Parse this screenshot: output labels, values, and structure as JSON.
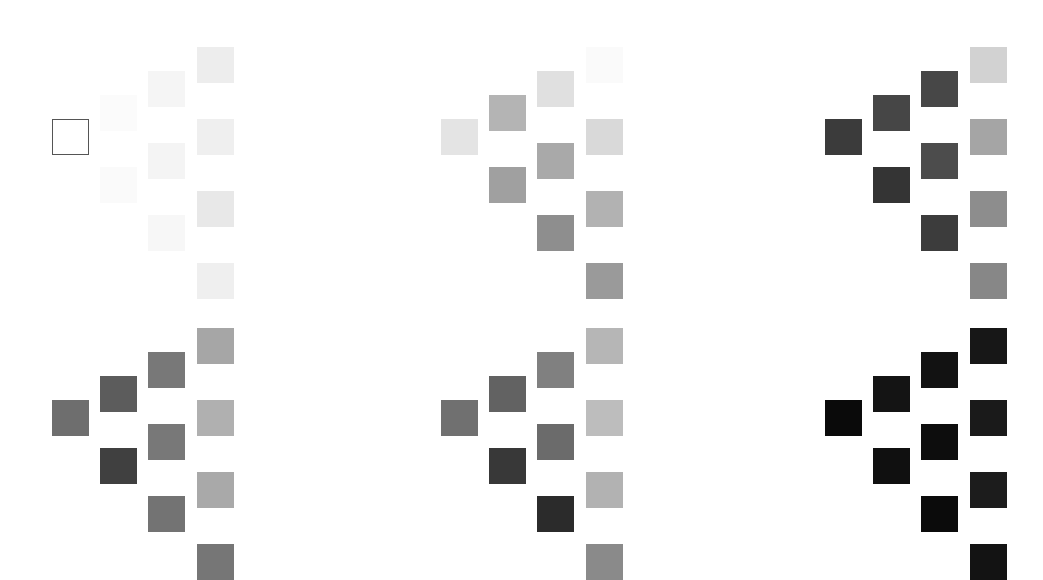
{
  "figure": {
    "title": "",
    "background_color": "#ffffff",
    "width": 1043,
    "height": 550,
    "panel_rows": 2,
    "panel_cols": 3,
    "panel_count": 6
  },
  "geometry": {
    "cell_width": 37,
    "cell_height": 36,
    "col_step": 48,
    "row_step": 48,
    "panel_x_origins": [
      52,
      441,
      825
    ],
    "panel_y_origins": [
      47,
      328
    ],
    "column_counts": [
      1,
      2,
      3,
      4
    ],
    "column_x_offsets": [
      0,
      48,
      96,
      145
    ],
    "column_y_offsets": [
      [
        72
      ],
      [
        48,
        120
      ],
      [
        24,
        96,
        168
      ],
      [
        0,
        72,
        144,
        216
      ]
    ]
  },
  "chart_data": {
    "type": "heatmap",
    "title": "",
    "subtitle": "",
    "xlabel": "",
    "ylabel": "",
    "legend": [],
    "grid": false,
    "value_range": [
      0,
      1
    ],
    "colormap": "grayscale",
    "panels": [
      {
        "index": 0,
        "name": "panel-top-left",
        "position": {
          "row": 0,
          "col": 0
        },
        "columns": [
          {
            "index": 0,
            "cells": [
              {
                "color": "#ffffff",
                "outlined": true,
                "value": 0.0
              }
            ]
          },
          {
            "index": 1,
            "cells": [
              {
                "color": "#fbfbfb",
                "outlined": false,
                "value": 0.02
              },
              {
                "color": "#fafafa",
                "outlined": false,
                "value": 0.02
              }
            ]
          },
          {
            "index": 2,
            "cells": [
              {
                "color": "#f5f5f5",
                "outlined": false,
                "value": 0.04
              },
              {
                "color": "#f4f4f4",
                "outlined": false,
                "value": 0.05
              },
              {
                "color": "#f7f7f7",
                "outlined": false,
                "value": 0.03
              }
            ]
          },
          {
            "index": 3,
            "cells": [
              {
                "color": "#ededed",
                "outlined": false,
                "value": 0.07
              },
              {
                "color": "#efefef",
                "outlined": false,
                "value": 0.06
              },
              {
                "color": "#e8e8e8",
                "outlined": false,
                "value": 0.09
              },
              {
                "color": "#efefef",
                "outlined": false,
                "value": 0.06
              }
            ]
          }
        ]
      },
      {
        "index": 1,
        "name": "panel-top-center",
        "position": {
          "row": 0,
          "col": 1
        },
        "columns": [
          {
            "index": 0,
            "cells": [
              {
                "color": "#e4e4e4",
                "outlined": false,
                "value": 0.11
              }
            ]
          },
          {
            "index": 1,
            "cells": [
              {
                "color": "#b4b4b4",
                "outlined": false,
                "value": 0.29
              },
              {
                "color": "#a0a0a0",
                "outlined": false,
                "value": 0.37
              }
            ]
          },
          {
            "index": 2,
            "cells": [
              {
                "color": "#e0e0e0",
                "outlined": false,
                "value": 0.12
              },
              {
                "color": "#a9a9a9",
                "outlined": false,
                "value": 0.34
              },
              {
                "color": "#8e8e8e",
                "outlined": false,
                "value": 0.44
              }
            ]
          },
          {
            "index": 3,
            "cells": [
              {
                "color": "#fafafa",
                "outlined": false,
                "value": 0.02
              },
              {
                "color": "#d9d9d9",
                "outlined": false,
                "value": 0.15
              },
              {
                "color": "#b2b2b2",
                "outlined": false,
                "value": 0.3
              },
              {
                "color": "#9a9a9a",
                "outlined": false,
                "value": 0.4
              }
            ]
          }
        ]
      },
      {
        "index": 2,
        "name": "panel-top-right",
        "position": {
          "row": 0,
          "col": 2
        },
        "columns": [
          {
            "index": 0,
            "cells": [
              {
                "color": "#3b3b3b",
                "outlined": false,
                "value": 0.77
              }
            ]
          },
          {
            "index": 1,
            "cells": [
              {
                "color": "#464646",
                "outlined": false,
                "value": 0.73
              },
              {
                "color": "#343434",
                "outlined": false,
                "value": 0.8
              }
            ]
          },
          {
            "index": 2,
            "cells": [
              {
                "color": "#474747",
                "outlined": false,
                "value": 0.72
              },
              {
                "color": "#4c4c4c",
                "outlined": false,
                "value": 0.7
              },
              {
                "color": "#3c3c3c",
                "outlined": false,
                "value": 0.76
              }
            ]
          },
          {
            "index": 3,
            "cells": [
              {
                "color": "#d2d2d2",
                "outlined": false,
                "value": 0.18
              },
              {
                "color": "#a5a5a5",
                "outlined": false,
                "value": 0.35
              },
              {
                "color": "#8d8d8d",
                "outlined": false,
                "value": 0.45
              },
              {
                "color": "#878787",
                "outlined": false,
                "value": 0.47
              }
            ]
          }
        ]
      },
      {
        "index": 3,
        "name": "panel-bottom-left",
        "position": {
          "row": 1,
          "col": 0
        },
        "columns": [
          {
            "index": 0,
            "cells": [
              {
                "color": "#6e6e6e",
                "outlined": false,
                "value": 0.57
              }
            ]
          },
          {
            "index": 1,
            "cells": [
              {
                "color": "#5c5c5c",
                "outlined": false,
                "value": 0.64
              },
              {
                "color": "#404040",
                "outlined": false,
                "value": 0.75
              }
            ]
          },
          {
            "index": 2,
            "cells": [
              {
                "color": "#787878",
                "outlined": false,
                "value": 0.53
              },
              {
                "color": "#787878",
                "outlined": false,
                "value": 0.53
              },
              {
                "color": "#737373",
                "outlined": false,
                "value": 0.55
              }
            ]
          },
          {
            "index": 3,
            "cells": [
              {
                "color": "#a6a6a6",
                "outlined": false,
                "value": 0.35
              },
              {
                "color": "#b0b0b0",
                "outlined": false,
                "value": 0.31
              },
              {
                "color": "#a9a9a9",
                "outlined": false,
                "value": 0.34
              },
              {
                "color": "#767676",
                "outlined": false,
                "value": 0.54
              }
            ]
          }
        ]
      },
      {
        "index": 4,
        "name": "panel-bottom-center",
        "position": {
          "row": 1,
          "col": 1
        },
        "columns": [
          {
            "index": 0,
            "cells": [
              {
                "color": "#707070",
                "outlined": false,
                "value": 0.56
              }
            ]
          },
          {
            "index": 1,
            "cells": [
              {
                "color": "#626262",
                "outlined": false,
                "value": 0.62
              },
              {
                "color": "#383838",
                "outlined": false,
                "value": 0.78
              }
            ]
          },
          {
            "index": 2,
            "cells": [
              {
                "color": "#808080",
                "outlined": false,
                "value": 0.5
              },
              {
                "color": "#6b6b6b",
                "outlined": false,
                "value": 0.58
              },
              {
                "color": "#2b2b2b",
                "outlined": false,
                "value": 0.83
              }
            ]
          },
          {
            "index": 3,
            "cells": [
              {
                "color": "#b6b6b6",
                "outlined": false,
                "value": 0.29
              },
              {
                "color": "#bdbdbd",
                "outlined": false,
                "value": 0.26
              },
              {
                "color": "#b2b2b2",
                "outlined": false,
                "value": 0.3
              },
              {
                "color": "#8a8a8a",
                "outlined": false,
                "value": 0.46
              }
            ]
          }
        ]
      },
      {
        "index": 5,
        "name": "panel-bottom-right",
        "position": {
          "row": 1,
          "col": 2
        },
        "columns": [
          {
            "index": 0,
            "cells": [
              {
                "color": "#0a0a0a",
                "outlined": false,
                "value": 0.96
              }
            ]
          },
          {
            "index": 1,
            "cells": [
              {
                "color": "#141414",
                "outlined": false,
                "value": 0.92
              },
              {
                "color": "#101010",
                "outlined": false,
                "value": 0.94
              }
            ]
          },
          {
            "index": 2,
            "cells": [
              {
                "color": "#121212",
                "outlined": false,
                "value": 0.93
              },
              {
                "color": "#0d0d0d",
                "outlined": false,
                "value": 0.95
              },
              {
                "color": "#0b0b0b",
                "outlined": false,
                "value": 0.96
              }
            ]
          },
          {
            "index": 3,
            "cells": [
              {
                "color": "#171717",
                "outlined": false,
                "value": 0.91
              },
              {
                "color": "#1a1a1a",
                "outlined": false,
                "value": 0.9
              },
              {
                "color": "#1c1c1c",
                "outlined": false,
                "value": 0.89
              },
              {
                "color": "#131313",
                "outlined": false,
                "value": 0.93
              }
            ]
          }
        ]
      }
    ]
  }
}
